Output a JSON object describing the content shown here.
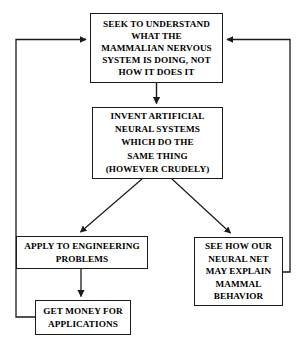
{
  "diagram": {
    "stroke_color": "#1a1a1a",
    "background_color": "#ffffff",
    "nodes": [
      {
        "id": "seek",
        "name": "seek-to-understand-box",
        "lines": [
          "SEEK TO UNDERSTAND",
          "WHAT THE",
          "MAMMALIAN NERVOUS",
          "SYSTEM IS DOING, NOT",
          "HOW IT DOES IT"
        ]
      },
      {
        "id": "invent",
        "name": "invent-artificial-neural-systems-box",
        "lines": [
          "INVENT ARTIFICIAL",
          "NEURAL SYSTEMS",
          "WHICH DO THE",
          "SAME THING",
          "(HOWEVER CRUDELY)"
        ]
      },
      {
        "id": "apply",
        "name": "apply-to-engineering-problems-box",
        "lines": [
          "APPLY TO ENGINEERING",
          "PROBLEMS"
        ]
      },
      {
        "id": "see",
        "name": "see-how-our-neural-net-box",
        "lines": [
          "SEE HOW OUR",
          "NEURAL NET",
          "MAY EXPLAIN",
          "MAMMAL",
          "BEHAVIOR"
        ]
      },
      {
        "id": "money",
        "name": "get-money-for-applications-box",
        "lines": [
          "GET MONEY FOR",
          "APPLICATIONS"
        ]
      }
    ],
    "edges": [
      {
        "id": "seek-to-invent",
        "from": "seek",
        "to": "invent",
        "style": "straight-down-arrow"
      },
      {
        "id": "invent-to-apply",
        "from": "invent",
        "to": "apply",
        "style": "diagonal-down-left-arrow"
      },
      {
        "id": "invent-to-see",
        "from": "invent",
        "to": "see",
        "style": "diagonal-down-right-arrow"
      },
      {
        "id": "apply-to-money",
        "from": "apply",
        "to": "money",
        "style": "straight-down-arrow"
      },
      {
        "id": "money-to-seek",
        "from": "money",
        "to": "seek",
        "style": "left-feedback-loop-arrow"
      },
      {
        "id": "see-to-seek",
        "from": "see",
        "to": "seek",
        "style": "right-feedback-loop-arrow"
      }
    ]
  }
}
